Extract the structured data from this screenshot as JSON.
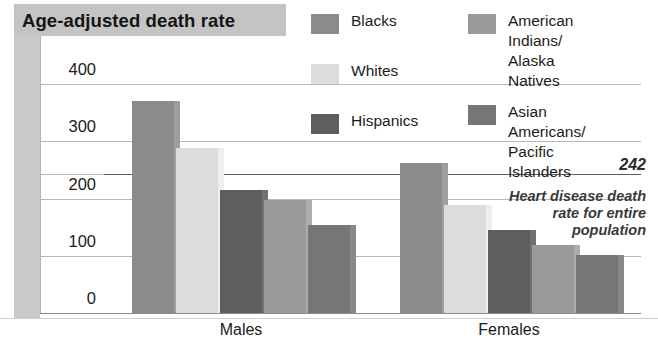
{
  "chart_data": {
    "type": "bar",
    "title": "Age-adjusted death rate",
    "xlabel": "",
    "ylabel": "Age-adjusted death rate",
    "categories": [
      "Males",
      "Females"
    ],
    "ylim": [
      0,
      400
    ],
    "yticks": [
      0,
      100,
      200,
      300,
      400
    ],
    "grid": true,
    "legend_position": "top-right",
    "series": [
      {
        "name": "Blacks",
        "color": "#8c8c8c",
        "values": [
          370,
          262
        ]
      },
      {
        "name": "Whites",
        "color": "#dcdcdc",
        "values": [
          288,
          189
        ]
      },
      {
        "name": "Hispanics",
        "color": "#5e5e5e",
        "values": [
          215,
          145
        ]
      },
      {
        "name": "American Indians/\nAlaska Natives",
        "color": "#9a9a9a",
        "values": [
          197,
          119
        ]
      },
      {
        "name": "Asian Americans/\nPacific Islanders",
        "color": "#767676",
        "values": [
          154,
          101
        ]
      }
    ],
    "annotations": [
      {
        "name": "reference-line",
        "value": 242,
        "label": "242",
        "text": "Heart disease death rate for entire population"
      }
    ]
  },
  "header": {
    "title": "Age-adjusted death rate"
  },
  "axis": {
    "tick_400": "400",
    "tick_300": "300",
    "tick_200": "200",
    "tick_100": "100",
    "tick_0": "0",
    "group_males": "Males",
    "group_females": "Females"
  },
  "legend": {
    "items": [
      {
        "label": "Blacks",
        "color": "#8c8c8c"
      },
      {
        "label": "Whites",
        "color": "#dcdcdc"
      },
      {
        "label": "Hispanics",
        "color": "#5e5e5e"
      },
      {
        "label": "American Indians/\nAlaska Natives",
        "color": "#9a9a9a"
      },
      {
        "label": "Asian Americans/\nPacific Islanders",
        "color": "#767676"
      }
    ]
  },
  "annotation": {
    "value": "242",
    "line1": "Heart disease death",
    "line2": "rate for entire",
    "line3": "population",
    "full_text": "Heart disease death rate for entire population"
  }
}
